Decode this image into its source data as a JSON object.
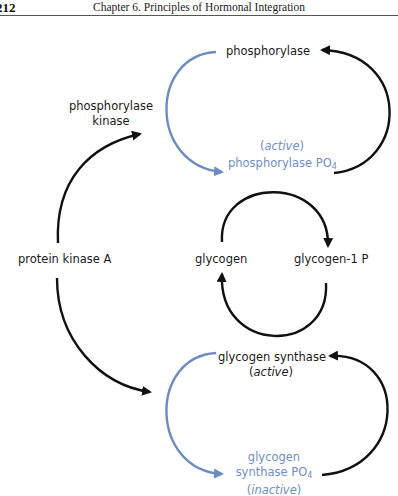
{
  "header": {
    "page_number": "212",
    "chapter_title": "Chapter 6.  Principles of Hormonal Integration"
  },
  "colors": {
    "black_arrow": "#111111",
    "blue_arrow": "#6a8cc4",
    "blue_text": "#6e8fc2"
  },
  "diagram": {
    "nodes": {
      "phosphorylase": "phosphorylase",
      "phosphorylase_po4_state": "active",
      "phosphorylase_po4_name": "phosphorylase PO",
      "phosphorylase_po4_sub": "4",
      "phosphorylase_kinase_line1": "phosphorylase",
      "phosphorylase_kinase_line2": "kinase",
      "protein_kinase_a": "protein kinase A",
      "glycogen": "glycogen",
      "glycogen_1p": "glycogen-1 P",
      "glycogen_synthase": "glycogen synthase",
      "glycogen_synthase_state": "active",
      "glycogen_synthase_po4_line1": "glycogen",
      "glycogen_synthase_po4_line2": "synthase PO",
      "glycogen_synthase_po4_sub": "4",
      "glycogen_synthase_po4_state": "inactive"
    },
    "edges": [
      {
        "from": "phosphorylase",
        "to": "phosphorylase PO4",
        "color": "blue",
        "label": "phosphorylation"
      },
      {
        "from": "phosphorylase PO4",
        "to": "phosphorylase",
        "color": "black"
      },
      {
        "from": "protein kinase A",
        "to": "phosphorylase kinase",
        "color": "black"
      },
      {
        "from": "protein kinase A",
        "to": "glycogen synthase",
        "color": "black"
      },
      {
        "from": "glycogen",
        "to": "glycogen-1 P",
        "color": "black"
      },
      {
        "from": "glycogen-1 P",
        "to": "glycogen",
        "color": "black"
      },
      {
        "from": "glycogen synthase",
        "to": "glycogen synthase PO4",
        "color": "blue"
      },
      {
        "from": "glycogen synthase PO4",
        "to": "glycogen synthase",
        "color": "black"
      }
    ]
  }
}
